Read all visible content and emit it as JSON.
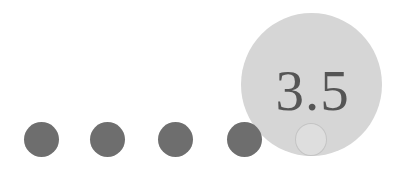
{
  "rating": {
    "value_label": "3.5",
    "filled_dots": 4,
    "partial_dots": 1
  },
  "colors": {
    "background": "#ffffff",
    "dot_filled": "#6e6e6e",
    "lens_fill": "#d6d6d6",
    "lens_text": "#555555",
    "partial_dot_fill": "#dedede",
    "partial_dot_outline": "#c4c4c4"
  },
  "dots": [
    {
      "x": 24
    },
    {
      "x": 90
    },
    {
      "x": 158
    },
    {
      "x": 227
    }
  ],
  "icons": {
    "dot": "filled-circle",
    "partial_dot": "outlined-circle",
    "lens": "magnifier-circle"
  }
}
